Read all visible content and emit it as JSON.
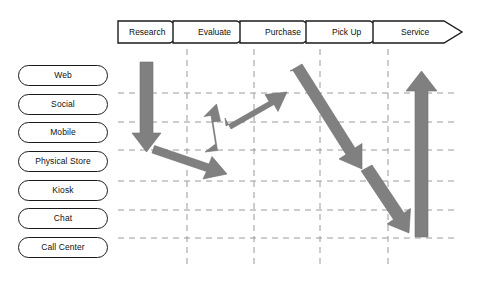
{
  "diagram": {
    "type": "customer-journey-channel-matrix",
    "title": "",
    "colors": {
      "arrow_fill": "#808080",
      "arrow_stroke": "#6e6e6e",
      "outline": "#1b1b1b",
      "grid": "#9a9a9a",
      "background": "#ffffff",
      "text": "#111111"
    },
    "stages": [
      {
        "label": "Research",
        "x": 118,
        "width": 69
      },
      {
        "label": "Evaluate",
        "x": 187,
        "width": 67
      },
      {
        "label": "Purchase",
        "x": 254,
        "width": 66
      },
      {
        "label": "Pick Up",
        "x": 320,
        "width": 68
      },
      {
        "label": "Service",
        "x": 388,
        "width": 74
      }
    ],
    "channels": [
      {
        "label": "Web",
        "y": 65
      },
      {
        "label": "Social",
        "y": 94
      },
      {
        "label": "Mobile",
        "y": 122
      },
      {
        "label": "Physical Store",
        "y": 151
      },
      {
        "label": "Kiosk",
        "y": 180
      },
      {
        "label": "Chat",
        "y": 208
      },
      {
        "label": "Call Center",
        "y": 237
      }
    ],
    "grid": {
      "horizontal_y": [
        93,
        122,
        150,
        181,
        210,
        238
      ],
      "vertical_x": [
        187,
        254,
        320,
        388
      ],
      "x_start": 118,
      "x_end": 458,
      "y_start": 56,
      "y_end": 268,
      "dashed": true
    },
    "flow_arrows": [
      {
        "name": "research-web-to-physical-store",
        "from_stage": "Research",
        "from_channel": "Web",
        "to_stage": "Research",
        "to_channel": "Physical Store",
        "direction": "down"
      },
      {
        "name": "research-to-evaluate-down",
        "from_stage": "Research",
        "from_channel": "Physical Store",
        "to_stage": "Evaluate",
        "to_channel": "Physical Store",
        "direction": "down-right"
      },
      {
        "name": "evaluate-up-short",
        "from_stage": "Evaluate",
        "from_channel": "Physical Store",
        "to_stage": "Evaluate",
        "to_channel": "Mobile",
        "direction": "up"
      },
      {
        "name": "evaluate-to-purchase-up",
        "from_stage": "Evaluate",
        "from_channel": "Mobile",
        "to_stage": "Purchase",
        "to_channel": "Web",
        "direction": "up-right"
      },
      {
        "name": "purchase-to-pickup-down",
        "from_stage": "Purchase",
        "from_channel": "Web",
        "to_stage": "Pick Up",
        "to_channel": "Physical Store",
        "direction": "down-right"
      },
      {
        "name": "pickup-to-service-down",
        "from_stage": "Pick Up",
        "from_channel": "Physical Store",
        "to_stage": "Pick Up",
        "to_channel": "Chat",
        "direction": "down-right"
      },
      {
        "name": "service-up-tall",
        "from_stage": "Service",
        "from_channel": "Call Center",
        "to_stage": "Service",
        "to_channel": "Web",
        "direction": "up"
      }
    ]
  }
}
